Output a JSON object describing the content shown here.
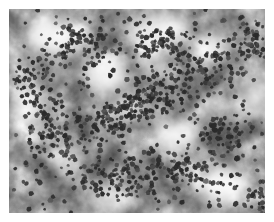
{
  "document": {
    "type": "grayscale-micrograph",
    "width": 274,
    "height": 222,
    "page_background": "#ffffff",
    "caption": "",
    "title": ""
  },
  "image_panel": {
    "name": "micrograph",
    "left": 9,
    "top": 9,
    "width": 256,
    "height": 204,
    "colorspace": "grayscale",
    "base_gray": "#c5c5c5",
    "highlight_gray": "#ffffff",
    "midtone_gray": "#a8a8a8",
    "shadow_gray": "#6e6e6e",
    "blob_color": "#2b2b2b",
    "blob_color_light": "#4a4a4a",
    "border_color": "#ffffff"
  },
  "background_field": {
    "description": "mottled cloudy grayscale stroma with bright lacunae",
    "turbulence_base_frequency": 0.035,
    "turbulence_octaves": 4,
    "turbulence_seed": 17,
    "contrast_slope": 1.55,
    "contrast_intercept": -0.18,
    "blur": 0.6,
    "light_patches": [
      {
        "cx": 44,
        "cy": 28,
        "rx": 26,
        "ry": 20,
        "opacity": 0.92
      },
      {
        "cx": 150,
        "cy": 22,
        "rx": 30,
        "ry": 17,
        "opacity": 0.85
      },
      {
        "cx": 201,
        "cy": 40,
        "rx": 19,
        "ry": 15,
        "opacity": 0.78
      },
      {
        "cx": 96,
        "cy": 66,
        "rx": 24,
        "ry": 18,
        "opacity": 0.88
      },
      {
        "cx": 20,
        "cy": 96,
        "rx": 17,
        "ry": 22,
        "opacity": 0.8
      },
      {
        "cx": 120,
        "cy": 100,
        "rx": 16,
        "ry": 13,
        "opacity": 0.7
      },
      {
        "cx": 246,
        "cy": 88,
        "rx": 15,
        "ry": 19,
        "opacity": 0.74
      },
      {
        "cx": 168,
        "cy": 128,
        "rx": 22,
        "ry": 16,
        "opacity": 0.86
      },
      {
        "cx": 58,
        "cy": 150,
        "rx": 18,
        "ry": 14,
        "opacity": 0.66
      },
      {
        "cx": 214,
        "cy": 176,
        "rx": 25,
        "ry": 19,
        "opacity": 0.95
      },
      {
        "cx": 104,
        "cy": 188,
        "rx": 20,
        "ry": 14,
        "opacity": 0.72
      },
      {
        "cx": 146,
        "cy": 60,
        "rx": 13,
        "ry": 11,
        "opacity": 0.62
      }
    ],
    "dark_veils": [
      {
        "cx": 130,
        "cy": 92,
        "rx": 62,
        "ry": 26,
        "rot": -22,
        "opacity": 0.34
      },
      {
        "cx": 46,
        "cy": 58,
        "rx": 34,
        "ry": 22,
        "rot": 15,
        "opacity": 0.26
      },
      {
        "cx": 206,
        "cy": 112,
        "rx": 40,
        "ry": 26,
        "rot": 30,
        "opacity": 0.24
      },
      {
        "cx": 86,
        "cy": 160,
        "rx": 46,
        "ry": 22,
        "rot": -10,
        "opacity": 0.22
      },
      {
        "cx": 172,
        "cy": 196,
        "rx": 44,
        "ry": 16,
        "rot": 6,
        "opacity": 0.2
      },
      {
        "cx": 14,
        "cy": 178,
        "rx": 24,
        "ry": 20,
        "rot": 0,
        "opacity": 0.18
      }
    ]
  },
  "blob_field": {
    "description": "dark stained nuclei scattered across the field, clustered along a central diagonal band",
    "count": 980,
    "radius_min": 1.4,
    "radius_max": 2.9,
    "irregularity": 0.38,
    "seed": 9137,
    "clusters": [
      {
        "cx": 132,
        "cy": 96,
        "sx": 40,
        "sy": 20,
        "weight": 150,
        "rot": -25
      },
      {
        "cx": 70,
        "cy": 40,
        "sx": 34,
        "sy": 24,
        "weight": 95,
        "rot": 10
      },
      {
        "cx": 196,
        "cy": 56,
        "sx": 36,
        "sy": 28,
        "weight": 105,
        "rot": 0
      },
      {
        "cx": 42,
        "cy": 128,
        "sx": 28,
        "sy": 32,
        "weight": 90,
        "rot": 0
      },
      {
        "cx": 110,
        "cy": 168,
        "sx": 44,
        "sy": 22,
        "weight": 110,
        "rot": 8
      },
      {
        "cx": 216,
        "cy": 130,
        "sx": 30,
        "sy": 28,
        "weight": 85,
        "rot": -15
      },
      {
        "cx": 178,
        "cy": 162,
        "sx": 32,
        "sy": 18,
        "weight": 70,
        "rot": 20
      },
      {
        "cx": 24,
        "cy": 72,
        "sx": 20,
        "sy": 30,
        "weight": 60,
        "rot": 0
      },
      {
        "cx": 244,
        "cy": 30,
        "sx": 18,
        "sy": 24,
        "weight": 50,
        "rot": 0
      },
      {
        "cx": 150,
        "cy": 30,
        "sx": 34,
        "sy": 16,
        "weight": 65,
        "rot": -6
      },
      {
        "cx": 90,
        "cy": 112,
        "sx": 26,
        "sy": 22,
        "weight": 55,
        "rot": 0
      },
      {
        "cx": 248,
        "cy": 190,
        "sx": 16,
        "sy": 16,
        "weight": 30,
        "rot": 0
      }
    ],
    "uniform_scatter": 180
  }
}
